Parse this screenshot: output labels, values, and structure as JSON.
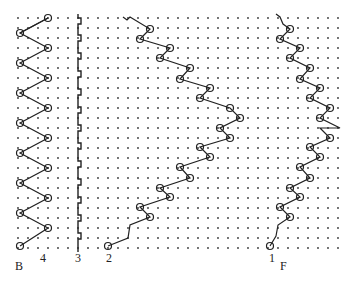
{
  "figure": {
    "labels": {
      "b": "B",
      "f": "F",
      "stitch_4": "4",
      "stitch_3": "3",
      "stitch_2": "2",
      "stitch_1": "1"
    },
    "grid": {
      "x_start": 18,
      "x_end": 340,
      "dx": 10,
      "y_start": 18,
      "y_end": 248,
      "dy": 10,
      "dot_color": "#333333"
    },
    "stroke_color": "#222222"
  }
}
